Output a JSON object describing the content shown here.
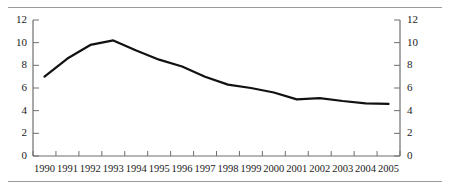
{
  "chart_data": {
    "type": "line",
    "title": "",
    "subtitle": "",
    "xlabel": "",
    "ylabel": "",
    "categories": [
      "1990",
      "1991",
      "1992",
      "1993",
      "1994",
      "1995",
      "1996",
      "1997",
      "1998",
      "1999",
      "2000",
      "2001",
      "2002",
      "2003",
      "2004",
      "2005"
    ],
    "series": [
      {
        "name": "series-1",
        "values": [
          7.0,
          8.6,
          9.8,
          10.2,
          9.3,
          8.5,
          7.9,
          7.0,
          6.3,
          6.0,
          5.6,
          5.0,
          5.1,
          4.85,
          4.65,
          4.6
        ],
        "color": "#111111",
        "line_width": 2.2
      }
    ],
    "ylim": [
      0,
      12
    ],
    "y_ticks": [
      0,
      2,
      4,
      6,
      8,
      10,
      12
    ],
    "y_ticks_left": [
      "0",
      "2",
      "4",
      "6",
      "8",
      "10",
      "12"
    ],
    "y_ticks_right": [
      "0",
      "2",
      "4",
      "6",
      "8",
      "10",
      "12"
    ],
    "x_tick_labels": [
      "1990",
      "1991",
      "1992",
      "1993",
      "1994",
      "1995",
      "1996",
      "1997",
      "1998",
      "1999",
      "2000",
      "2001",
      "2002",
      "2003",
      "2004",
      "2005"
    ],
    "grid": false,
    "legend": null,
    "legend_position": "none",
    "axes": {
      "left_axis_visible": true,
      "right_axis_visible": true,
      "bottom_axis_visible": true,
      "top_axis_visible": false,
      "axis_color": "#6e6e6e"
    },
    "rules": {
      "top_rule": true,
      "bottom_rule": true,
      "rule_color": "#9a9a9a"
    }
  }
}
